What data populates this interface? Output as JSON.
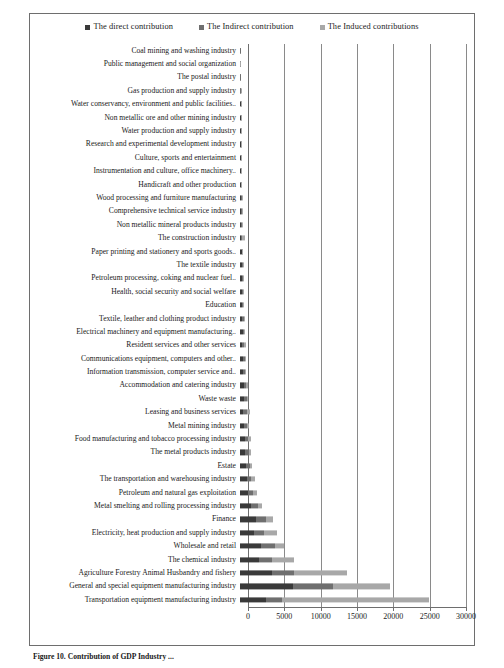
{
  "figure": {
    "caption": "Figure 10. Contribution of GDP Industry ...",
    "axis_max": 30000
  },
  "legend": {
    "items": [
      {
        "label": "The direct contribution",
        "color": "#3a3a3a",
        "key": "direct"
      },
      {
        "label": "The Indirect contribution",
        "color": "#6f6f6f",
        "key": "indirect"
      },
      {
        "label": "The Induced contributions",
        "color": "#a8a8a8",
        "key": "induced"
      }
    ]
  },
  "chart_data": {
    "type": "bar",
    "orientation": "horizontal",
    "stacked": true,
    "title": "",
    "xlabel": "",
    "ylabel": "",
    "xlim": [
      0,
      30000
    ],
    "xticks": [
      0,
      5000,
      10000,
      15000,
      20000,
      25000,
      30000
    ],
    "xtick_labels": [
      "0",
      "5000",
      "10000",
      "15000",
      "20000",
      "25000",
      "30000"
    ],
    "grid": true,
    "legend_position": "top",
    "series": [
      {
        "name": "The direct contribution",
        "color": "#3a3a3a"
      },
      {
        "name": "The Indirect contribution",
        "color": "#6f6f6f"
      },
      {
        "name": "The Induced contributions",
        "color": "#a8a8a8"
      }
    ],
    "categories": [
      "Coal mining and washing industry",
      "Public management and social organization",
      "The postal industry",
      "Gas production and supply industry",
      "Water conservancy, environment and public facilities..",
      "Non metallic ore and other mining industry",
      "Water production and supply industry",
      "Research and experimental development industry",
      "Culture, sports and entertainment",
      "Instrumentation and culture, office machinery..",
      "Handicraft and other production",
      "Wood processing and furniture manufacturing",
      "Comprehensive technical service industry",
      "Non metallic mineral products industry",
      "The construction industry",
      "Paper printing and stationery and sports goods..",
      "The textile industry",
      "Petroleum processing, coking and nuclear fuel..",
      "Health, social security and social welfare",
      "Education",
      "Textile, leather and clothing product industry",
      "Electrical machinery and equipment manufacturing..",
      "Resident services and other services",
      "Communications equipment, computers and other..",
      "Information transmission, computer service and..",
      "Accommodation and catering industry",
      "Waste waste",
      "Leasing and business services",
      "Metal mining industry",
      "Food manufacturing and tobacco processing industry",
      "The metal products industry",
      "Estate",
      "The transportation and warehousing industry",
      "Petroleum and natural gas exploitation",
      "Metal smelting and rolling processing industry",
      "Finance",
      "Electricity, heat production and supply industry",
      "Wholesale and retail",
      "The chemical industry",
      "Agriculture Forestry Animal Husbandry and fishery",
      "General and special equipment manufacturing industry",
      "Transportation equipment manufacturing industry"
    ],
    "values": {
      "direct": [
        60,
        50,
        55,
        60,
        70,
        80,
        90,
        100,
        110,
        120,
        130,
        150,
        170,
        190,
        120,
        200,
        230,
        250,
        260,
        280,
        330,
        350,
        220,
        380,
        400,
        480,
        520,
        420,
        560,
        700,
        720,
        800,
        900,
        1050,
        1450,
        2100,
        1900,
        2800,
        2500,
        4300,
        7100,
        3400
      ],
      "indirect": [
        20,
        15,
        20,
        25,
        30,
        35,
        40,
        45,
        50,
        60,
        70,
        80,
        90,
        100,
        180,
        120,
        130,
        140,
        150,
        160,
        200,
        230,
        350,
        260,
        280,
        320,
        350,
        480,
        380,
        420,
        450,
        500,
        620,
        700,
        900,
        1400,
        1300,
        1800,
        1700,
        2900,
        5200,
        2200
      ],
      "induced": [
        10,
        10,
        10,
        15,
        15,
        20,
        20,
        25,
        30,
        35,
        40,
        45,
        50,
        55,
        330,
        60,
        65,
        70,
        80,
        90,
        110,
        130,
        260,
        150,
        170,
        200,
        220,
        460,
        250,
        280,
        300,
        340,
        420,
        480,
        600,
        900,
        1700,
        1200,
        3000,
        7000,
        7600,
        19500
      ]
    }
  }
}
